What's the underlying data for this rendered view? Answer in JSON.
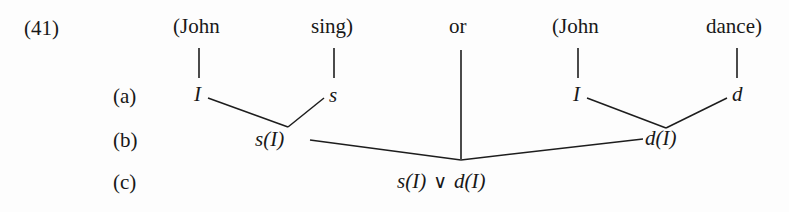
{
  "figure": {
    "number": "(41)",
    "row_labels": {
      "a": "(a)",
      "b": "(b)",
      "c": "(c)"
    },
    "top_row": {
      "left_subject": "(John",
      "left_predicate": "sing)",
      "connective": "or",
      "right_subject": "(John",
      "right_predicate": "dance)"
    },
    "row_a": {
      "left_subject_symbol": "I",
      "left_predicate_symbol": "s",
      "right_subject_symbol": "I",
      "right_predicate_symbol": "d"
    },
    "row_b": {
      "left_result": "s(I)",
      "right_result": "d(I)"
    },
    "row_c": {
      "result": "s(I) ∨ d(I)",
      "result_left": "s(I)",
      "result_operator": "∨",
      "result_right": "d(I)"
    },
    "colors": {
      "ink": "#181818",
      "line": "#1d1d1d",
      "paper": "#fdfdfd"
    }
  }
}
